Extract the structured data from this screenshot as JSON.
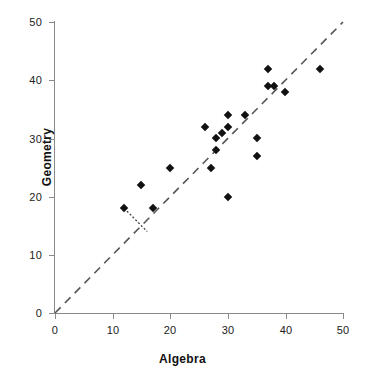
{
  "chart_data": {
    "type": "scatter",
    "title": "",
    "xlabel": "Algebra",
    "ylabel": "Geometry",
    "xlim": [
      0,
      50
    ],
    "ylim": [
      0,
      50
    ],
    "xticks": [
      0,
      10,
      20,
      30,
      40,
      50
    ],
    "yticks": [
      0,
      10,
      20,
      30,
      40,
      50
    ],
    "grid": false,
    "legend": "none",
    "marker": "filled-diamond",
    "marker_color": "#111111",
    "points": [
      {
        "x": 12,
        "y": 18
      },
      {
        "x": 15,
        "y": 22
      },
      {
        "x": 17,
        "y": 18
      },
      {
        "x": 20,
        "y": 25
      },
      {
        "x": 26,
        "y": 32
      },
      {
        "x": 27,
        "y": 25
      },
      {
        "x": 28,
        "y": 30
      },
      {
        "x": 28,
        "y": 28
      },
      {
        "x": 29,
        "y": 31
      },
      {
        "x": 30,
        "y": 32
      },
      {
        "x": 30,
        "y": 34
      },
      {
        "x": 30,
        "y": 20
      },
      {
        "x": 33,
        "y": 34
      },
      {
        "x": 35,
        "y": 30
      },
      {
        "x": 35,
        "y": 27
      },
      {
        "x": 37,
        "y": 42
      },
      {
        "x": 37,
        "y": 39
      },
      {
        "x": 38,
        "y": 39
      },
      {
        "x": 40,
        "y": 38
      },
      {
        "x": 46,
        "y": 42
      }
    ],
    "reference_line": {
      "name": "identity-line",
      "style": "dashed",
      "color": "#555555",
      "from": [
        0,
        0
      ],
      "to": [
        50,
        50
      ]
    },
    "annotation_line": {
      "name": "dotted-connector",
      "style": "dotted",
      "color": "#333333",
      "from": [
        12,
        18
      ],
      "to": [
        16,
        14
      ]
    }
  }
}
